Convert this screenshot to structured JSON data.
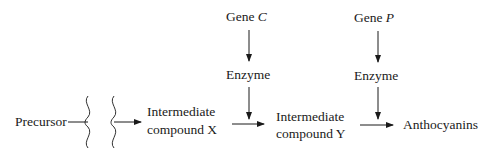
{
  "diagram": {
    "precursor": "Precursor",
    "compound_x": {
      "line1": "Intermediate",
      "line2": "compound X"
    },
    "compound_y": {
      "line1": "Intermediate",
      "line2": "compound Y"
    },
    "product": "Anthocyanins",
    "gene_c": {
      "prefix": "Gene ",
      "letter": "C",
      "enzyme": "Enzyme"
    },
    "gene_p": {
      "prefix": "Gene ",
      "letter": "P",
      "enzyme": "Enzyme"
    }
  }
}
